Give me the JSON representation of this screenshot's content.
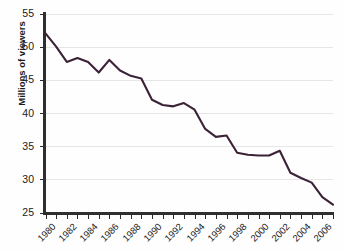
{
  "chart_data": {
    "type": "line",
    "title": "",
    "subtitle": "",
    "xlabel": "",
    "ylabel": "Millions of viewers",
    "x": [
      1980,
      1981,
      1982,
      1983,
      1984,
      1985,
      1986,
      1987,
      1988,
      1989,
      1990,
      1991,
      1992,
      1993,
      1994,
      1995,
      1996,
      1997,
      1998,
      1999,
      2000,
      2001,
      2002,
      2003,
      2004,
      2005,
      2006,
      2007
    ],
    "values": [
      52.0,
      50.0,
      47.7,
      48.3,
      47.7,
      46.1,
      48.0,
      46.4,
      45.6,
      45.2,
      42.0,
      41.2,
      41.0,
      41.5,
      40.5,
      37.6,
      36.4,
      36.6,
      34.0,
      33.7,
      33.6,
      33.6,
      34.3,
      31.0,
      30.2,
      29.5,
      27.3,
      26.2
    ],
    "series": [
      {
        "name": "Viewers",
        "color": "#3b2236",
        "values": [
          52.0,
          50.0,
          47.7,
          48.3,
          47.7,
          46.1,
          48.0,
          46.4,
          45.6,
          45.2,
          42.0,
          41.2,
          41.0,
          41.5,
          40.5,
          37.6,
          36.4,
          36.6,
          34.0,
          33.7,
          33.6,
          33.6,
          34.3,
          31.0,
          30.2,
          29.5,
          27.3,
          26.2
        ]
      }
    ],
    "ylim": [
      25,
      55
    ],
    "xlim": [
      1980,
      2007
    ],
    "ytick_labels": [
      "25",
      "30",
      "35",
      "40",
      "45",
      "50",
      "55"
    ],
    "ytick_values": [
      25,
      30,
      35,
      40,
      45,
      50,
      55
    ],
    "xtick_labels": [
      "1980",
      "1982",
      "1984",
      "1986",
      "1988",
      "1990",
      "1992",
      "1994",
      "1996",
      "1998",
      "2000",
      "2002",
      "2004",
      "2006"
    ],
    "xtick_values": [
      1980,
      1982,
      1984,
      1986,
      1988,
      1990,
      1992,
      1994,
      1996,
      1998,
      2000,
      2002,
      2004,
      2006
    ],
    "grid": true,
    "grid_axis": "y",
    "legend": false,
    "legend_position": "none",
    "annotations": []
  },
  "colors": {
    "line": "#3b2236",
    "grid": "#e6e6e6",
    "axis": "#2f2f2f",
    "text": "#1a1a1a",
    "background": "#fefefe"
  }
}
